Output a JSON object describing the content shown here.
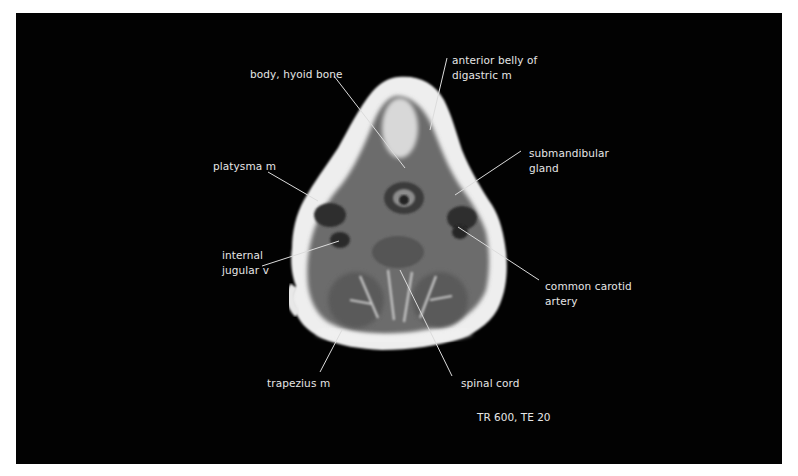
{
  "figure": {
    "type": "axial MRI cross-section of the neck",
    "background_color": "#020202",
    "label_color": "#e6e6e6",
    "sequence": "TR 600, TE 20"
  },
  "labels": [
    {
      "id": "body-hyoid-bone",
      "text": "body, hyoid bone",
      "x": 250,
      "y": 67
    },
    {
      "id": "anterior-belly-digastric",
      "text": "anterior belly of\ndigastric m",
      "x": 452,
      "y": 53
    },
    {
      "id": "submandibular-gland",
      "text": "submandibular\ngland",
      "x": 529,
      "y": 146
    },
    {
      "id": "platysma",
      "text": "platysma m",
      "x": 213,
      "y": 159
    },
    {
      "id": "internal-jugular",
      "text": "internal\njugular v",
      "x": 222,
      "y": 248
    },
    {
      "id": "common-carotid",
      "text": "common carotid\nartery",
      "x": 545,
      "y": 279
    },
    {
      "id": "trapezius",
      "text": "trapezius m",
      "x": 267,
      "y": 376
    },
    {
      "id": "spinal-cord",
      "text": "spinal cord",
      "x": 461,
      "y": 376
    }
  ],
  "caption": {
    "text": "TR 600, TE 20",
    "x": 477,
    "y": 410
  }
}
